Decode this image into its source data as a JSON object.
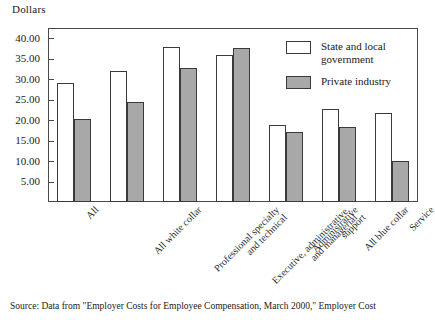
{
  "chart_data": {
    "type": "bar",
    "title": "",
    "ylabel": "Dollars",
    "xlabel": "",
    "ylim": [
      0,
      42.5
    ],
    "yticks": [
      "5.00",
      "10.00",
      "15.00",
      "20.00",
      "25.00",
      "30.00",
      "35.00",
      "40.00"
    ],
    "ytick_values": [
      5,
      10,
      15,
      20,
      25,
      30,
      35,
      40
    ],
    "grid": false,
    "legend_position": "top-right inside plot",
    "categories": [
      "All",
      "All white collar",
      "Professional specialty\nand technical",
      "Executive, administrative,\nand managerial",
      "Administrative\nsupport",
      "All blue collar",
      "Service"
    ],
    "series": [
      {
        "name": "State and local government",
        "color": "#ffffff",
        "values": [
          29.1,
          32.1,
          37.8,
          35.9,
          18.7,
          22.6,
          21.7
        ]
      },
      {
        "name": "Private industry",
        "color": "#a8a8a8",
        "values": [
          20.3,
          24.5,
          32.7,
          37.5,
          17.0,
          18.3,
          9.9
        ]
      }
    ]
  },
  "source": {
    "text": "Source: Data from \"Employer Costs for Employee Compensation, March 2000,\" Employer Cost"
  }
}
